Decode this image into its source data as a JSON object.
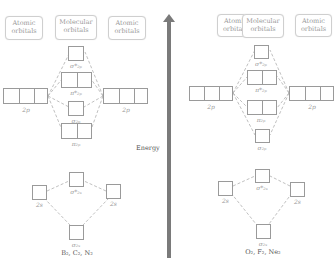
{
  "headers": {
    "atomic": [
      "Atomic",
      "orbitals"
    ],
    "molecular": [
      "Molecular",
      "orbitals"
    ]
  },
  "energy_label": "Energy",
  "left_diagram": {
    "molecules": "B₂, C₂, N₂",
    "atomic_2p": "2p",
    "atomic_2s": "2s",
    "mo_order_top_to_bottom": [
      "σ*2p",
      "π*2p",
      "σ2p",
      "π2p",
      "σ*2s",
      "σ2s"
    ],
    "labels": {
      "sigma_star_2p": "σ*₂ₚ",
      "pi_star_2p": "π*₂ₚ",
      "sigma_2p": "σ₂ₚ",
      "pi_2p": "π₂ₚ",
      "sigma_star_2s": "σ*₂ₛ",
      "sigma_2s": "σ₂ₛ"
    }
  },
  "right_diagram": {
    "molecules": "O₂, F₂, Ne₂",
    "atomic_2p": "2p",
    "atomic_2s": "2s",
    "mo_order_top_to_bottom": [
      "σ*2p",
      "π*2p",
      "π2p",
      "σ2p",
      "σ*2s",
      "σ2s"
    ],
    "labels": {
      "sigma_star_2p": "σ*₂ₚ",
      "pi_star_2p": "π*₂ₚ",
      "pi_2p": "π₂ₚ",
      "sigma_2p": "σ₂ₚ",
      "sigma_star_2s": "σ*₂ₛ",
      "sigma_2s": "σ₂ₛ"
    }
  }
}
